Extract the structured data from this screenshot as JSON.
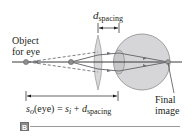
{
  "diagram": {
    "panel_label": "B",
    "labels": {
      "object": [
        "Object",
        "for eye"
      ],
      "d_spacing": {
        "var": "d",
        "sub": "spacing"
      },
      "final_image": [
        "Final",
        "image"
      ],
      "equation": {
        "lhs_var": "s",
        "lhs_sub": "o",
        "lhs_arg": "(eye) = ",
        "rhs_var1": "s",
        "rhs_sub1": "i",
        "plus": " + ",
        "rhs_var2": "d",
        "rhs_sub2": "spacing"
      }
    },
    "colors": {
      "axis": "#3a3a3a",
      "ray": "#6d6e71",
      "lens_fill": "#d9d9db",
      "eye_fill": "#d6d6d8",
      "dot": "#8c8c8c",
      "text": "#231f20"
    }
  }
}
